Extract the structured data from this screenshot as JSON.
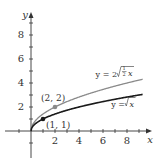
{
  "chart_data": {
    "type": "line",
    "title": "",
    "xlabel": "x",
    "ylabel": "y",
    "xlim": [
      0,
      9.5
    ],
    "ylim": [
      0,
      9.7
    ],
    "x_ticks": [
      2,
      4,
      6,
      8
    ],
    "y_ticks": [
      2,
      4,
      6,
      8
    ],
    "grid": false,
    "series": [
      {
        "name": "y = 2√(½x)",
        "color": "#8a8a8a",
        "x": [
          0,
          0.5,
          1,
          2,
          3,
          4,
          5,
          6,
          7,
          8,
          9
        ],
        "values": [
          0,
          1,
          1.414,
          2,
          2.449,
          2.828,
          3.162,
          3.464,
          3.742,
          4,
          4.243
        ]
      },
      {
        "name": "y = √x",
        "color": "#1a1a1a",
        "x": [
          0,
          0.5,
          1,
          2,
          3,
          4,
          5,
          6,
          7,
          8,
          9
        ],
        "values": [
          0,
          0.707,
          1,
          1.414,
          1.732,
          2,
          2.236,
          2.449,
          2.646,
          2.828,
          3
        ]
      }
    ],
    "annotations": [
      {
        "label": "(2, 2)",
        "x": 2,
        "y": 2,
        "color": "#8a8a8a"
      },
      {
        "label": "(1, 1)",
        "x": 1,
        "y": 1,
        "color": "#1a1a1a"
      }
    ]
  },
  "labels": {
    "x_axis": "x",
    "y_axis": "y",
    "tick_x": [
      "2",
      "4",
      "6",
      "8"
    ],
    "tick_y": [
      "2",
      "4",
      "6",
      "8"
    ],
    "curve_upper_prefix": "y = 2",
    "curve_upper_frac_num": "1",
    "curve_upper_frac_den": "2",
    "curve_upper_var": "x",
    "curve_lower_prefix": "y = ",
    "curve_lower_var": "x",
    "point_upper": "(2, 2)",
    "point_lower": "(1, 1)"
  }
}
